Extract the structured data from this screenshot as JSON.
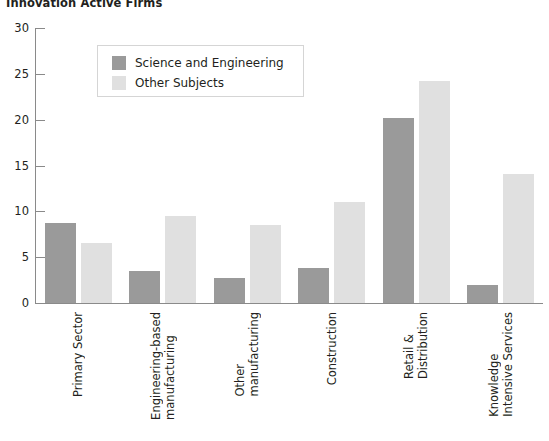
{
  "chart_data": {
    "type": "bar",
    "title": "Innovation Active Firms",
    "xlabel": "",
    "ylabel": "",
    "ylim": [
      0,
      30
    ],
    "yticks": [
      0,
      5,
      10,
      15,
      20,
      25,
      30
    ],
    "grid": false,
    "legend_position": "upper-left-inside",
    "categories": [
      "Primary Sector",
      "Engineering-based manufacturing",
      "Other manufacturing",
      "Construction",
      "Retail & Distribution",
      "Knowledge Intensive Services"
    ],
    "category_lines": [
      [
        "Primary Sector"
      ],
      [
        "Engineering-based",
        "manufacturing"
      ],
      [
        "Other",
        "manufacturing"
      ],
      [
        "Construction"
      ],
      [
        "Retail &",
        "Distribution"
      ],
      [
        "Knowledge",
        "Intensive Services"
      ]
    ],
    "series": [
      {
        "name": "Science and Engineering",
        "color": "#9a9a9a",
        "values": [
          8.7,
          3.5,
          2.7,
          3.8,
          20.2,
          2.0
        ]
      },
      {
        "name": "Other Subjects",
        "color": "#e0e0e0",
        "values": [
          6.5,
          9.5,
          8.5,
          11.0,
          24.2,
          14.1
        ]
      }
    ]
  },
  "legend": {
    "items": [
      {
        "label": "Science and Engineering",
        "swatch": "se"
      },
      {
        "label": "Other Subjects",
        "swatch": "os"
      }
    ]
  },
  "axis": {
    "y_tick_labels": [
      "0",
      "5",
      "10",
      "15",
      "20",
      "25",
      "30"
    ]
  }
}
